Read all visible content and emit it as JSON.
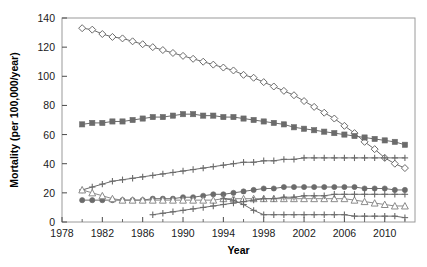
{
  "chart_data": {
    "type": "line",
    "title": "",
    "xlabel": "Year",
    "ylabel": "Mortality (per 100,000/year)",
    "xlim": [
      1978,
      2013
    ],
    "ylim": [
      0,
      140
    ],
    "xticks": [
      1978,
      1982,
      1986,
      1990,
      1994,
      1998,
      2002,
      2006,
      2010
    ],
    "yticks": [
      0,
      20,
      40,
      60,
      80,
      100,
      120,
      140
    ],
    "xtick_labels": [
      "1978",
      "1982",
      "1986",
      "1990",
      "1994",
      "1998",
      "2002",
      "2006",
      "2010"
    ],
    "ytick_labels": [
      "0",
      "20",
      "40",
      "60",
      "80",
      "100",
      "120",
      "140"
    ],
    "grid": false,
    "legend": "none",
    "minor_ticks_x": true,
    "series": [
      {
        "name": "series-open-diamond",
        "marker": "open-diamond",
        "color": "#6b6b6b",
        "x": [
          1980,
          1981,
          1982,
          1983,
          1984,
          1985,
          1986,
          1987,
          1988,
          1989,
          1990,
          1991,
          1992,
          1993,
          1994,
          1995,
          1996,
          1997,
          1998,
          1999,
          2000,
          2001,
          2002,
          2003,
          2004,
          2005,
          2006,
          2007,
          2008,
          2009,
          2010,
          2011,
          2012
        ],
        "y": [
          133,
          132,
          129,
          127,
          126,
          124,
          122,
          120,
          118,
          116,
          114,
          112,
          110,
          108,
          106,
          104,
          101,
          99,
          96,
          93,
          90,
          87,
          83,
          79,
          75,
          71,
          66,
          61,
          55,
          50,
          44,
          40,
          37
        ]
      },
      {
        "name": "series-filled-square",
        "marker": "filled-square",
        "color": "#6b6b6b",
        "x": [
          1980,
          1981,
          1982,
          1983,
          1984,
          1985,
          1986,
          1987,
          1988,
          1989,
          1990,
          1991,
          1992,
          1993,
          1994,
          1995,
          1996,
          1997,
          1998,
          1999,
          2000,
          2001,
          2002,
          2003,
          2004,
          2005,
          2006,
          2007,
          2008,
          2009,
          2010,
          2011,
          2012
        ],
        "y": [
          67,
          68,
          68,
          69,
          69,
          70,
          71,
          72,
          72,
          73,
          74,
          74,
          73,
          73,
          72,
          72,
          71,
          70,
          69,
          68,
          67,
          65,
          64,
          63,
          62,
          61,
          60,
          59,
          58,
          57,
          56,
          55,
          53
        ]
      },
      {
        "name": "series-rising-plus",
        "marker": "plus-circle",
        "color": "#6b6b6b",
        "x": [
          1980,
          1981,
          1982,
          1983,
          1984,
          1985,
          1986,
          1987,
          1988,
          1989,
          1990,
          1991,
          1992,
          1993,
          1994,
          1995,
          1996,
          1997,
          1998,
          1999,
          2000,
          2001,
          2002,
          2003,
          2004,
          2005,
          2006,
          2007,
          2008,
          2009,
          2010,
          2011,
          2012
        ],
        "y": [
          22,
          24,
          26,
          28,
          29,
          30,
          31,
          32,
          33,
          34,
          35,
          36,
          37,
          38,
          39,
          40,
          41,
          41,
          42,
          42,
          43,
          43,
          44,
          44,
          44,
          44,
          44,
          44,
          44,
          44,
          44,
          44,
          44
        ]
      },
      {
        "name": "series-mid-filled-circle",
        "marker": "filled-circle",
        "color": "#6b6b6b",
        "x": [
          1980,
          1981,
          1982,
          1983,
          1984,
          1985,
          1986,
          1987,
          1988,
          1989,
          1990,
          1991,
          1992,
          1993,
          1994,
          1995,
          1996,
          1997,
          1998,
          1999,
          2000,
          2001,
          2002,
          2003,
          2004,
          2005,
          2006,
          2007,
          2008,
          2009,
          2010,
          2011,
          2012
        ],
        "y": [
          15,
          15,
          15,
          15,
          15,
          15,
          15,
          16,
          16,
          16,
          17,
          17,
          18,
          19,
          19,
          20,
          21,
          22,
          23,
          23,
          24,
          24,
          24,
          24,
          24,
          24,
          24,
          24,
          23,
          23,
          23,
          22,
          22
        ]
      },
      {
        "name": "series-declining-open-triangle",
        "marker": "open-triangle",
        "color": "#8a8a8a",
        "x": [
          1980,
          1981,
          1982,
          1983,
          1984,
          1985,
          1986,
          1987,
          1988,
          1989,
          1990,
          1991,
          1992,
          1993,
          1994,
          1995,
          1996,
          1997,
          1998,
          1999,
          2000,
          2001,
          2002,
          2003,
          2004,
          2005,
          2006,
          2007,
          2008,
          2009,
          2010,
          2011,
          2012
        ],
        "y": [
          22,
          20,
          18,
          16,
          15,
          15,
          15,
          15,
          15,
          15,
          15,
          15,
          15,
          15,
          16,
          16,
          16,
          16,
          16,
          16,
          16,
          16,
          16,
          16,
          16,
          16,
          16,
          15,
          14,
          13,
          12,
          11,
          11
        ]
      },
      {
        "name": "series-low-plus",
        "marker": "plus-circle",
        "color": "#6b6b6b",
        "x": [
          1987,
          1988,
          1989,
          1990,
          1991,
          1992,
          1993,
          1994,
          1995,
          1996,
          1997,
          1998,
          1999,
          2000,
          2001,
          2002,
          2003,
          2004,
          2005,
          2006,
          2007,
          2008,
          2009,
          2010,
          2011,
          2012
        ],
        "y": [
          5,
          6,
          7,
          8,
          9,
          10,
          11,
          12,
          13,
          14,
          15,
          16,
          16,
          17,
          17,
          18,
          18,
          18,
          19,
          19,
          19,
          19,
          19,
          19,
          19,
          19
        ]
      },
      {
        "name": "series-dropping-plus",
        "marker": "plus-circle",
        "color": "#6b6b6b",
        "x": [
          1994,
          1995,
          1996,
          1997,
          1998,
          1999,
          2000,
          2001,
          2002,
          2003,
          2004,
          2005,
          2006,
          2007,
          2008,
          2009,
          2010,
          2011,
          2012
        ],
        "y": [
          16,
          15,
          12,
          8,
          5,
          5,
          5,
          5,
          5,
          5,
          5,
          5,
          5,
          4,
          4,
          4,
          4,
          4,
          3
        ]
      }
    ]
  }
}
